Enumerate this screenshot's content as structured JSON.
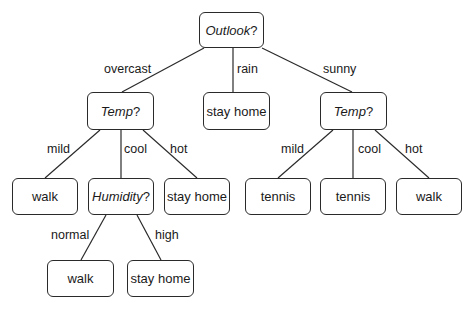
{
  "diagram": {
    "type": "decision-tree",
    "root": {
      "attribute": "Outlook",
      "suffix": "?"
    },
    "nodes": {
      "outlook": {
        "attribute": "Outlook",
        "suffix": "?"
      },
      "temp_left": {
        "attribute": "Temp",
        "suffix": "?"
      },
      "rain_leaf": {
        "label": "stay home"
      },
      "temp_right": {
        "attribute": "Temp",
        "suffix": "?"
      },
      "tl_mild_leaf": {
        "label": "walk"
      },
      "humidity": {
        "attribute": "Humidity",
        "suffix": "?"
      },
      "tl_hot_leaf": {
        "label": "stay home"
      },
      "tr_mild_leaf": {
        "label": "tennis"
      },
      "tr_cool_leaf": {
        "label": "tennis"
      },
      "tr_hot_leaf": {
        "label": "walk"
      },
      "hum_normal_leaf": {
        "label": "walk"
      },
      "hum_high_leaf": {
        "label": "stay home"
      }
    },
    "edges": {
      "overcast": "overcast",
      "rain": "rain",
      "sunny": "sunny",
      "tl_mild": "mild",
      "tl_cool": "cool",
      "tl_hot": "hot",
      "tr_mild": "mild",
      "tr_cool": "cool",
      "tr_hot": "hot",
      "hum_normal": "normal",
      "hum_high": "high"
    }
  }
}
